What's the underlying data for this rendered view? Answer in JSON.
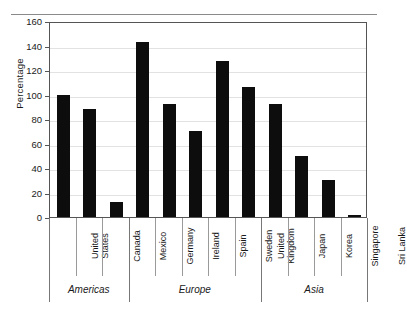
{
  "chart_data": {
    "type": "bar",
    "title": "",
    "subtitle": "",
    "xlabel": "",
    "ylabel": "Percentage",
    "ylim": [
      0,
      160
    ],
    "yticks": [
      0,
      20,
      40,
      60,
      80,
      100,
      120,
      140,
      160
    ],
    "ytick_labels": [
      "0",
      "20",
      "40",
      "60",
      "80",
      "100",
      "120",
      "140",
      "160"
    ],
    "grid": true,
    "legend": "none",
    "bar_color": "#0d0d0d",
    "categories": [
      "United States",
      "Canada",
      "Mexico",
      "Germany",
      "Ireland",
      "Spain",
      "Sweden",
      "United Kingdom",
      "Japan",
      "Korea",
      "Singapore",
      "Sri Lanka"
    ],
    "category_lines": [
      [
        "United",
        "States"
      ],
      [
        "Canada"
      ],
      [
        "Mexico"
      ],
      [
        "Germany"
      ],
      [
        "Ireland"
      ],
      [
        "Spain"
      ],
      [
        "Sweden"
      ],
      [
        "United",
        "Kingdom"
      ],
      [
        "Japan"
      ],
      [
        "Korea"
      ],
      [
        "Singapore"
      ],
      [
        "Sri Lanka"
      ]
    ],
    "values": [
      100,
      88,
      12,
      143,
      92,
      70,
      127,
      106,
      92,
      50,
      30,
      2
    ],
    "groups": [
      {
        "label": "Americas",
        "start": 0,
        "end": 2
      },
      {
        "label": "Europe",
        "start": 3,
        "end": 7
      },
      {
        "label": "Asia",
        "start": 8,
        "end": 11
      }
    ]
  }
}
